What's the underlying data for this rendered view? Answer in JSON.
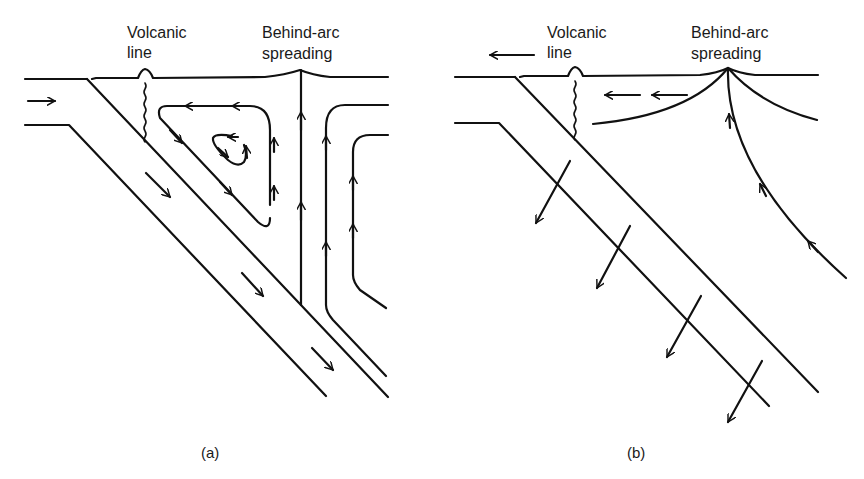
{
  "figure": {
    "panel_a": {
      "caption": "(a)",
      "labels": {
        "volcanic_line_1": "Volcanic",
        "volcanic_line_2": "line",
        "behind_arc_1": "Behind-arc",
        "behind_arc_2": "spreading"
      }
    },
    "panel_b": {
      "caption": "(b)",
      "labels": {
        "volcanic_line_1": "Volcanic",
        "volcanic_line_2": "line",
        "behind_arc_1": "Behind-arc",
        "behind_arc_2": "spreading"
      }
    },
    "colors": {
      "ink": "#111111",
      "background": "#ffffff"
    }
  }
}
